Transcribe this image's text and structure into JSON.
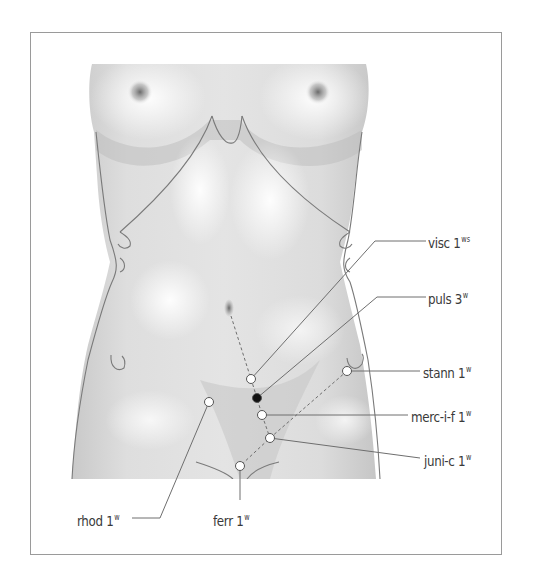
{
  "figure": {
    "type": "anatomical-point-diagram"
  },
  "points": [
    {
      "id": "visc",
      "remedy": "visc",
      "dose": "1",
      "grade": "ws",
      "x": 251,
      "y": 379,
      "fill": "#ffffff"
    },
    {
      "id": "puls",
      "remedy": "puls",
      "dose": "3",
      "grade": "w",
      "x": 257,
      "y": 398,
      "fill": "#111111"
    },
    {
      "id": "stann",
      "remedy": "stann",
      "dose": "1",
      "grade": "w",
      "x": 347,
      "y": 371,
      "fill": "#ffffff"
    },
    {
      "id": "merc-i-f",
      "remedy": "merc-i-f",
      "dose": "1",
      "grade": "w",
      "x": 262,
      "y": 415,
      "fill": "#ffffff"
    },
    {
      "id": "juni-c",
      "remedy": "juni-c",
      "dose": "1",
      "grade": "w",
      "x": 270,
      "y": 438,
      "fill": "#ffffff"
    },
    {
      "id": "rhod",
      "remedy": "rhod",
      "dose": "1",
      "grade": "w",
      "x": 209,
      "y": 402,
      "fill": "#ffffff"
    },
    {
      "id": "ferr",
      "remedy": "ferr",
      "dose": "1",
      "grade": "w",
      "x": 240,
      "y": 466,
      "fill": "#ffffff"
    }
  ],
  "labels": {
    "visc": {
      "text": "visc 1",
      "sup": "ws"
    },
    "puls": {
      "text": "puls 3",
      "sup": "w"
    },
    "stann": {
      "text": "stann 1",
      "sup": "w"
    },
    "merc_i_f": {
      "text": "merc-i-f 1",
      "sup": "w"
    },
    "juni_c": {
      "text": "juni-c 1",
      "sup": "w"
    },
    "rhod": {
      "text": "rhod 1",
      "sup": "w"
    },
    "ferr": {
      "text": "ferr 1",
      "sup": "w"
    }
  },
  "colors": {
    "frame": "#9a9a9a",
    "leader_line": "#6e6e6e",
    "body_outline": "#7a7a7a",
    "text": "#3a3a3a"
  }
}
